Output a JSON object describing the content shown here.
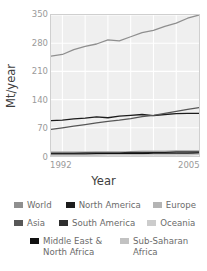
{
  "chart_data": {
    "type": "line",
    "title": "",
    "xlabel": "Year",
    "ylabel": "Mt/year",
    "xlim": [
      1992,
      2005
    ],
    "ylim": [
      0,
      350
    ],
    "yticks": [
      350,
      280,
      210,
      140,
      70,
      0
    ],
    "xticks": [
      1992,
      2005
    ],
    "xtick_labels": [
      "1992",
      "2005"
    ],
    "ytick_labels": [
      "350",
      "280",
      "210",
      "140",
      "70",
      "0"
    ],
    "grid": true,
    "legend_position": "below",
    "x": [
      1992,
      1993,
      1994,
      1995,
      1996,
      1997,
      1998,
      1999,
      2000,
      2001,
      2002,
      2003,
      2004,
      2005
    ],
    "series": [
      {
        "name": "World",
        "color": "#8f8f8f",
        "values": [
          248,
          252,
          264,
          272,
          278,
          288,
          286,
          296,
          306,
          312,
          322,
          330,
          342,
          350
        ]
      },
      {
        "name": "North America",
        "color": "#1c1c1c",
        "values": [
          88,
          89,
          92,
          94,
          97,
          95,
          99,
          101,
          103,
          100,
          103,
          105,
          106,
          106
        ]
      },
      {
        "name": "Europe",
        "color": "#b4b4b4",
        "values": [
          10,
          10,
          10,
          10,
          11,
          11,
          11,
          11,
          12,
          12,
          12,
          13,
          13,
          13
        ]
      },
      {
        "name": "Asia",
        "color": "#575757",
        "values": [
          66,
          70,
          74,
          78,
          82,
          86,
          89,
          93,
          98,
          101,
          106,
          111,
          116,
          120
        ]
      },
      {
        "name": "South America",
        "color": "#2e2e2e",
        "values": [
          7,
          7,
          7,
          8,
          8,
          8,
          8,
          9,
          9,
          9,
          9,
          10,
          10,
          10
        ]
      },
      {
        "name": "Oceania",
        "color": "#cccccc",
        "values": [
          3,
          3,
          3,
          3,
          3,
          4,
          4,
          4,
          4,
          4,
          4,
          4,
          5,
          5
        ]
      },
      {
        "name": "Middle East & North Africa",
        "color": "#111111",
        "values": [
          5,
          5,
          5,
          5,
          6,
          6,
          6,
          6,
          6,
          7,
          7,
          7,
          7,
          8
        ]
      },
      {
        "name": "Sub-Saharan Africa",
        "color": "#c2c2c2",
        "values": [
          2,
          2,
          2,
          2,
          2,
          3,
          3,
          3,
          3,
          3,
          3,
          3,
          3,
          4
        ]
      }
    ]
  },
  "legend": {
    "rows": [
      [
        {
          "label": "World",
          "color": "#8f8f8f"
        },
        {
          "label": "North America",
          "color": "#1c1c1c"
        },
        {
          "label": "Europe",
          "color": "#b4b4b4"
        }
      ],
      [
        {
          "label": "Asia",
          "color": "#575757"
        },
        {
          "label": "South America",
          "color": "#2e2e2e"
        },
        {
          "label": "Oceania",
          "color": "#cccccc"
        }
      ],
      [
        {
          "label": "Middle East &\nNorth Africa",
          "color": "#111111"
        },
        {
          "label": "Sub-Saharan\nAfrica",
          "color": "#c2c2c2"
        }
      ]
    ]
  }
}
